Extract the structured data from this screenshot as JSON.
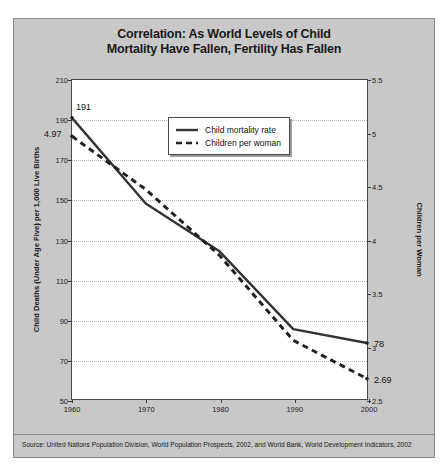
{
  "chart_data": {
    "type": "line",
    "title": "Correlation: As World Levels of Child Mortality Have Fallen, Fertility Has Fallen",
    "title_line1": "Correlation: As World Levels of Child",
    "title_line2": "Mortality Have Fallen, Fertility Has Fallen",
    "xlabel": "",
    "x": [
      1960,
      1970,
      1980,
      1990,
      2000
    ],
    "xtick_labels": [
      "1960",
      "1970",
      "1980",
      "1990",
      "2000"
    ],
    "xlim": [
      1960,
      2000
    ],
    "grid": true,
    "legend_position": "upper right",
    "series": [
      {
        "name": "Child mortality rate",
        "axis": "left",
        "style": "solid",
        "color": "#333333",
        "values": [
          191,
          148,
          124,
          85,
          78
        ]
      },
      {
        "name": "Children per woman",
        "axis": "right",
        "style": "dashed",
        "color": "#222222",
        "values": [
          4.97,
          4.47,
          3.85,
          3.05,
          2.69
        ]
      }
    ],
    "left_axis": {
      "label": "Child Deaths (Under Age Five) per 1,000 Live Births",
      "ylim": [
        50,
        210
      ],
      "ticks": [
        50,
        70,
        90,
        110,
        130,
        150,
        170,
        190,
        210
      ],
      "tick_labels": [
        "50",
        "70",
        "90",
        "110",
        "130",
        "150",
        "170",
        "190",
        "210"
      ]
    },
    "right_axis": {
      "label": "Children per Woman",
      "ylim": [
        2.5,
        5.5
      ],
      "ticks": [
        2.5,
        3,
        3.5,
        4,
        4.5,
        5,
        5.5
      ],
      "tick_labels": [
        "2.5",
        "3",
        "3.5",
        "4",
        "4.5",
        "5",
        "5.5"
      ]
    },
    "annotations": [
      {
        "text": "191",
        "x": 1960,
        "value": 191,
        "axis": "left"
      },
      {
        "text": "4.97",
        "x": 1960,
        "value": 4.97,
        "axis": "right"
      },
      {
        "text": "78",
        "x": 2000,
        "value": 78,
        "axis": "left"
      },
      {
        "text": "2.69",
        "x": 2000,
        "value": 2.69,
        "axis": "right"
      }
    ]
  },
  "legend": {
    "items": [
      {
        "label": "Child mortality rate",
        "style": "solid"
      },
      {
        "label": "Children per woman",
        "style": "dashed"
      }
    ]
  },
  "source": {
    "text": "Source: United Nations Population Division, World Population Prospects, 2002, and World Bank, World Development Indicators, 2002"
  },
  "colors": {
    "panel_background": "#c8c8c8",
    "plot_background": "#ffffff",
    "frame": "#4a4a4a",
    "gridline": "#b5b5b5",
    "series_solid": "#333333",
    "series_dashed": "#222222"
  }
}
